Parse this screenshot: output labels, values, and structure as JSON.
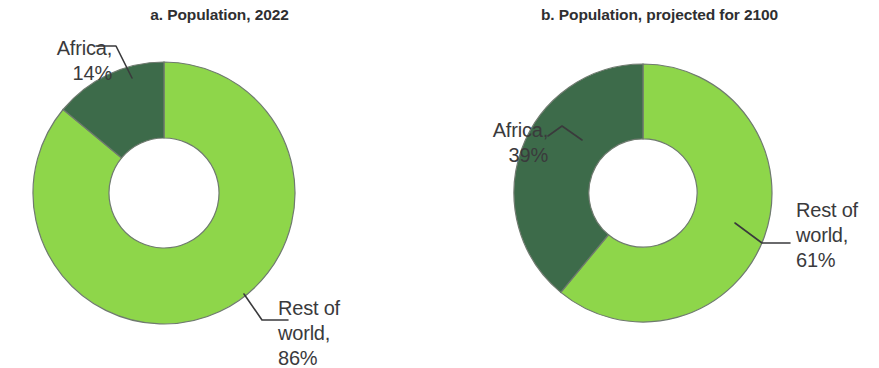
{
  "figure": {
    "background_color": "#ffffff",
    "text_color": "#3a3a3c",
    "africa_color": "#3d6b4a",
    "rest_color": "#8ed64a"
  },
  "panels": [
    {
      "id": "a",
      "title": "a. Population, 2022",
      "africa_label": "Africa,\n14%",
      "rest_label": "Rest of\nworld,\n86%"
    },
    {
      "id": "b",
      "title": "b. Population, projected for 2100",
      "africa_label": "Africa,\n39%",
      "rest_label": "Rest of\nworld,\n61%"
    }
  ],
  "chart_data": [
    {
      "type": "pie",
      "variant": "donut",
      "title": "a. Population, 2022",
      "labels": [
        "Rest of world",
        "Africa"
      ],
      "values": [
        86,
        14
      ],
      "value_unit": "%",
      "data_labels": [
        "Rest of world, 86%",
        "Africa, 14%"
      ],
      "colors": [
        "#8ed64a",
        "#3d6b4a"
      ],
      "start_angle_deg": 0,
      "direction": "Africa counter-clockwise from 12 o'clock",
      "hole_fraction": 0.42,
      "legend": "none",
      "grid": false
    },
    {
      "type": "pie",
      "variant": "donut",
      "title": "b. Population, projected for 2100",
      "labels": [
        "Rest of world",
        "Africa"
      ],
      "values": [
        61,
        39
      ],
      "value_unit": "%",
      "data_labels": [
        "Rest of world, 61%",
        "Africa, 39%"
      ],
      "colors": [
        "#8ed64a",
        "#3d6b4a"
      ],
      "start_angle_deg": 0,
      "direction": "Africa counter-clockwise from 12 o'clock",
      "hole_fraction": 0.42,
      "legend": "none",
      "grid": false
    }
  ]
}
